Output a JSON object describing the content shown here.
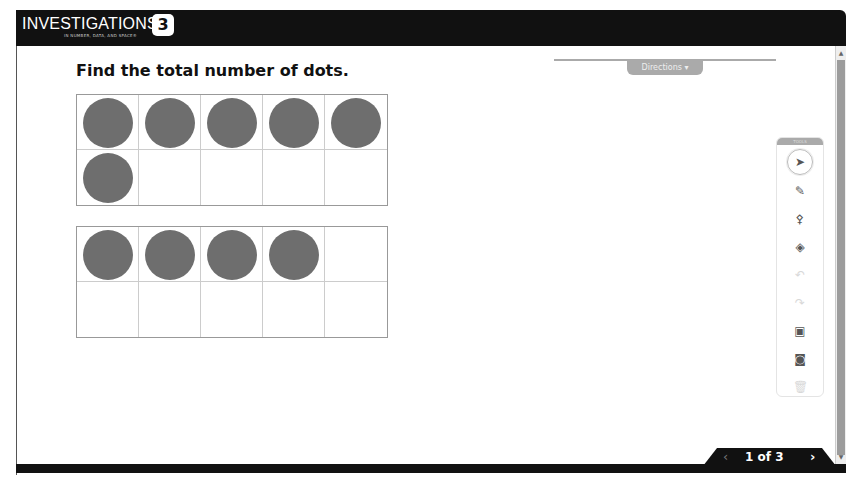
{
  "header": {
    "logo_text": "INVESTIGATIONS",
    "logo_subtitle": "IN NUMBER, DATA, AND SPACE®",
    "logo_badge": "3"
  },
  "directions": {
    "label": "Directions ▾"
  },
  "question": {
    "prompt": "Find the total number of dots."
  },
  "ten_frames": [
    {
      "filled": 6,
      "cells": 10
    },
    {
      "filled": 4,
      "cells": 10
    }
  ],
  "toolbox": {
    "header_label": "TOOLS",
    "tools": [
      {
        "name": "select",
        "glyph": "➤",
        "state": "selected"
      },
      {
        "name": "pencil",
        "glyph": "✎",
        "state": "enabled"
      },
      {
        "name": "stamp",
        "glyph": "⚴",
        "state": "enabled"
      },
      {
        "name": "eraser",
        "glyph": "◈",
        "state": "enabled"
      },
      {
        "name": "undo",
        "glyph": "↶",
        "state": "disabled"
      },
      {
        "name": "redo",
        "glyph": "↷",
        "state": "disabled"
      },
      {
        "name": "text-box",
        "glyph": "▣",
        "state": "enabled"
      },
      {
        "name": "shape",
        "glyph": "◙",
        "state": "enabled"
      },
      {
        "name": "trash",
        "glyph": "🗑",
        "state": "disabled"
      }
    ]
  },
  "pagination": {
    "prev": "‹",
    "label": "1 of 3",
    "next": "›"
  }
}
